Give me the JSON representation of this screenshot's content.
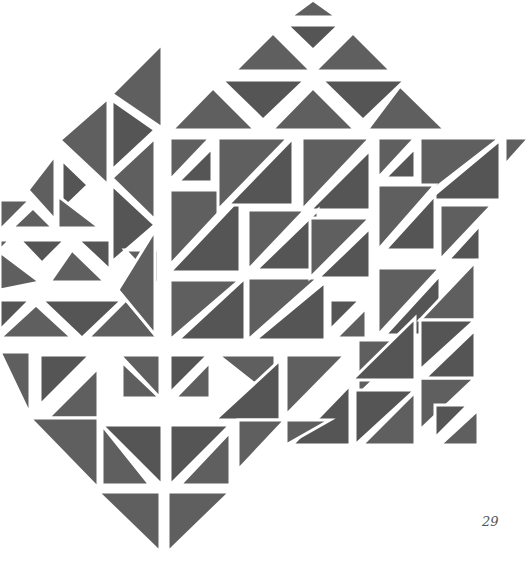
{
  "page": {
    "number": "29",
    "background": "#ffffff",
    "tile_color": "#5f5f5f",
    "tile_color_dark": "#555555",
    "gap_color": "#ffffff"
  },
  "figure": {
    "tiles": [
      {
        "pts": "290,17 337,17 313,0",
        "tone": "a"
      },
      {
        "pts": "287,25 339,25 313,50",
        "tone": "b"
      },
      {
        "pts": "235,71 311,71 273,33",
        "tone": "a"
      },
      {
        "pts": "315,71 391,71 353,33",
        "tone": "a"
      },
      {
        "pts": "222,80 305,80 263,120",
        "tone": "b"
      },
      {
        "pts": "322,80 405,80 363,120",
        "tone": "b"
      },
      {
        "pts": "172,130 255,130 213,88",
        "tone": "a"
      },
      {
        "pts": "272,130 355,130 313,88",
        "tone": "a"
      },
      {
        "pts": "367,130 445,130 400,86",
        "tone": "a"
      },
      {
        "pts": "162,44 162,128 112,94",
        "tone": "a"
      },
      {
        "pts": "112,100 155,130 112,170",
        "tone": "b"
      },
      {
        "pts": "108,98 108,185 60,140",
        "tone": "a"
      },
      {
        "pts": "112,178 155,138 155,220",
        "tone": "a"
      },
      {
        "pts": "155,225 112,185 112,262",
        "tone": "b"
      },
      {
        "pts": "55,155 55,220 28,190",
        "tone": "a"
      },
      {
        "pts": "62,160 88,185 62,210",
        "tone": "b"
      },
      {
        "pts": "58,228 100,228 58,196",
        "tone": "a"
      },
      {
        "pts": "0,200 30,200 0,230",
        "tone": "a"
      },
      {
        "pts": "12,228 53,228 33,208",
        "tone": "a"
      },
      {
        "pts": "20,240 65,240 42,263",
        "tone": "b"
      },
      {
        "pts": "0,240 10,240 0,250",
        "tone": "a"
      },
      {
        "pts": "0,252 40,282 0,290",
        "tone": "a"
      },
      {
        "pts": "50,282 105,282 72,250",
        "tone": "a"
      },
      {
        "pts": "78,240 110,270 110,240",
        "tone": "b"
      },
      {
        "pts": "0,300 30,300 0,330",
        "tone": "b"
      },
      {
        "pts": "0,338 72,338 36,305",
        "tone": "a"
      },
      {
        "pts": "42,300 122,300 82,338",
        "tone": "b"
      },
      {
        "pts": "88,338 158,338 126,300",
        "tone": "a"
      },
      {
        "pts": "125,250 158,285 158,250",
        "tone": "a"
      },
      {
        "pts": "155,230 155,335 118,290",
        "tone": "a"
      },
      {
        "pts": "170,138 170,180 210,138",
        "tone": "a"
      },
      {
        "pts": "178,182 212,182 212,148",
        "tone": "b"
      },
      {
        "pts": "170,190 170,265 240,190",
        "tone": "a"
      },
      {
        "pts": "170,272 240,272 240,198",
        "tone": "b"
      },
      {
        "pts": "218,138 288,138 218,210",
        "tone": "a"
      },
      {
        "pts": "228,205 293,205 293,138",
        "tone": "b"
      },
      {
        "pts": "302,138 370,138 302,210",
        "tone": "a"
      },
      {
        "pts": "310,210 370,210 370,150",
        "tone": "b"
      },
      {
        "pts": "170,280 240,280 170,340",
        "tone": "a"
      },
      {
        "pts": "178,340 245,340 245,278",
        "tone": "b"
      },
      {
        "pts": "248,210 305,210 248,270",
        "tone": "a"
      },
      {
        "pts": "256,270 318,270 318,210",
        "tone": "b"
      },
      {
        "pts": "248,278 318,278 248,340",
        "tone": "a"
      },
      {
        "pts": "255,340 325,340 325,282",
        "tone": "b"
      },
      {
        "pts": "310,218 370,218 310,278",
        "tone": "a"
      },
      {
        "pts": "318,278 370,278 370,228",
        "tone": "b"
      },
      {
        "pts": "330,300 360,300 330,330",
        "tone": "b"
      },
      {
        "pts": "336,338 366,338 366,308",
        "tone": "a"
      },
      {
        "pts": "378,138 378,178 415,138",
        "tone": "a"
      },
      {
        "pts": "385,178 415,178 415,148",
        "tone": "b"
      },
      {
        "pts": "420,138 500,138 420,200",
        "tone": "a"
      },
      {
        "pts": "428,200 500,200 500,140",
        "tone": "b"
      },
      {
        "pts": "505,138 529,138 505,165",
        "tone": "a"
      },
      {
        "pts": "378,185 435,185 378,250",
        "tone": "a"
      },
      {
        "pts": "385,250 435,250 435,195",
        "tone": "b"
      },
      {
        "pts": "440,205 492,205 440,260",
        "tone": "a"
      },
      {
        "pts": "448,260 480,260 480,225",
        "tone": "b"
      },
      {
        "pts": "378,268 440,268 378,335",
        "tone": "a"
      },
      {
        "pts": "385,335 440,335 440,275",
        "tone": "b"
      },
      {
        "pts": "420,320 475,320 475,262",
        "tone": "a"
      },
      {
        "pts": "420,320 475,320 420,370",
        "tone": "b"
      },
      {
        "pts": "358,340 415,340 358,395",
        "tone": "a"
      },
      {
        "pts": "352,380 415,380 415,318",
        "tone": "b"
      },
      {
        "pts": "420,378 475,378 420,430",
        "tone": "a"
      },
      {
        "pts": "425,378 475,378 475,330",
        "tone": "b"
      },
      {
        "pts": "355,390 415,390 355,445",
        "tone": "b"
      },
      {
        "pts": "362,445 415,445 415,392",
        "tone": "a"
      },
      {
        "pts": "435,405 468,405 435,438",
        "tone": "b"
      },
      {
        "pts": "440,445 478,445 478,410",
        "tone": "a"
      },
      {
        "pts": "286,355 345,355 286,415",
        "tone": "a"
      },
      {
        "pts": "292,445 350,445 350,385",
        "tone": "b"
      },
      {
        "pts": "286,420 330,420 286,445",
        "tone": "a"
      },
      {
        "pts": "0,352 30,352 30,415",
        "tone": "a"
      },
      {
        "pts": "40,355 90,355 40,405",
        "tone": "b"
      },
      {
        "pts": "48,418 98,418 98,368",
        "tone": "a"
      },
      {
        "pts": "118,355 158,355 158,395",
        "tone": "b"
      },
      {
        "pts": "122,362 122,398 160,398",
        "tone": "a"
      },
      {
        "pts": "120,355 160,355 160,398",
        "tone": "a"
      },
      {
        "pts": "170,355 208,355 170,393",
        "tone": "b"
      },
      {
        "pts": "175,398 210,398 210,362",
        "tone": "a"
      },
      {
        "pts": "218,355 275,355 275,400",
        "tone": "a"
      },
      {
        "pts": "215,420 280,420 280,360",
        "tone": "b"
      },
      {
        "pts": "30,418 98,418 98,488",
        "tone": "a"
      },
      {
        "pts": "102,425 162,425 162,485",
        "tone": "b"
      },
      {
        "pts": "102,425 102,485 150,485",
        "tone": "a"
      },
      {
        "pts": "170,425 230,425 170,485",
        "tone": "b"
      },
      {
        "pts": "180,485 230,485 230,432",
        "tone": "a"
      },
      {
        "pts": "238,420 285,420 238,470",
        "tone": "a"
      },
      {
        "pts": "98,492 160,492 160,552",
        "tone": "a"
      },
      {
        "pts": "168,492 230,492 168,552",
        "tone": "a"
      }
    ]
  }
}
